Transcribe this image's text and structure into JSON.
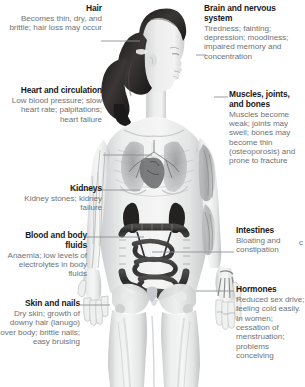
{
  "diagram": {
    "text_color_title": "#1a1a1a",
    "text_color_body": "#6f7376",
    "leader_color": "#8d9194",
    "background": "#ffffff"
  },
  "callouts": [
    {
      "id": "hair",
      "side": "left",
      "title": "Hair",
      "body": "Becomes thin, dry, and brittle; hair loss may occur"
    },
    {
      "id": "heart",
      "side": "left",
      "title": "Heart and circulation",
      "body": "Low blood pressure; slow heart rate; palpitations; heart failure"
    },
    {
      "id": "kidneys",
      "side": "left",
      "title": "Kidneys",
      "body": "Kidney stones; kidney failure"
    },
    {
      "id": "blood",
      "side": "left",
      "title": "Blood and body fluids",
      "body": "Anaemia; low levels of electrolytes in body fluids"
    },
    {
      "id": "skin",
      "side": "left",
      "title": "Skin and nails",
      "body": "Dry skin; growth of downy hair (lanugo) over body; brittle nails; easy bruising"
    },
    {
      "id": "brain",
      "side": "right",
      "title": "Brain and nervous system",
      "body": "Tiredness; fainting; depression; moodiness; impaired memory and concentration"
    },
    {
      "id": "muscles",
      "side": "right",
      "title": "Muscles, joints, and bones",
      "body": "Muscles become weak; joints may swell; bones may become thin (osteoporosis) and prone to fracture"
    },
    {
      "id": "intestines",
      "side": "right",
      "title": "Intestines",
      "body": "Bloating and constipation"
    },
    {
      "id": "hormones",
      "side": "right",
      "title": "Hormones",
      "body": "Reduced sex drive; feeling cold easily. In women; cessation of menstruation; problems conceiving"
    }
  ],
  "clipped_text": {
    "intestines_edge_fragment": "c"
  }
}
